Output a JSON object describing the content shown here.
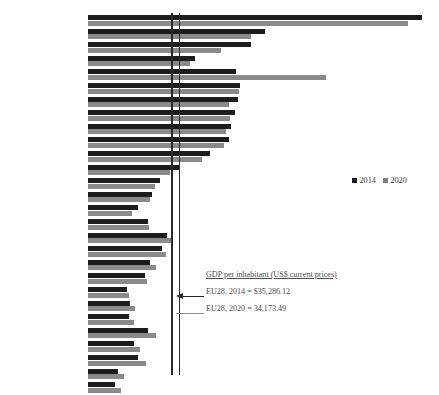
{
  "chart_data": {
    "type": "bar",
    "orientation": "horizontal",
    "title": "",
    "xlabel": "",
    "ylabel": "",
    "grid": false,
    "legend_position": "right-middle",
    "categories": [
      "Luxembourg",
      "Denmark",
      "Sweden",
      "United Kingdom",
      "Ireland",
      "Netherlands",
      "Austria",
      "Finland",
      "Germany",
      "Belgium",
      "France",
      "Italy",
      "Spain",
      "Cyprus",
      "Greece",
      "Portugal",
      "Malta",
      "Slovenia",
      "Czech Republic",
      "Slovak Republic",
      "Croatia",
      "Hungary",
      "Poland",
      "Estonia",
      "Latvia",
      "Lithuania",
      "Romania",
      ""
    ],
    "series": [
      {
        "name": "2014",
        "color": "#1c1c1c",
        "values": [
          119225,
          62549,
          59181,
          47425,
          42175,
          52300,
          51786,
          50343,
          48042,
          47316,
          43011,
          35518,
          29461,
          27194,
          21761,
          22080,
          24460,
          24002,
          20828,
          18500,
          13480,
          14100,
          14270,
          20170,
          15692,
          16540,
          10020,
          9650
        ]
      },
      {
        "name": "2020",
        "color": "#8a8a8a",
        "values": [
          115874,
          60915,
          52130,
          40318,
          85268,
          52397,
          48587,
          48981,
          46208,
          45159,
          39907,
          31676,
          26832,
          26624,
          17676,
          22440,
          27855,
          25517,
          22931,
          19157,
          13828,
          15899,
          15656,
          23027,
          17619,
          19998,
          12813,
          11000
        ]
      }
    ],
    "reference_lines": [
      {
        "name": "EU28, 2014",
        "value": 35286.12,
        "color": "#2a2a2a"
      },
      {
        "name": "EU28, 2020",
        "value": 34173.49,
        "color": "#2a2a2a"
      }
    ],
    "annotation": {
      "title": "GDP per inhabitant (US$ current prices)",
      "line_2014": "EU28, 2014 = $35,286.12",
      "line_2020": "EU28, 2020 = 34,173.49"
    },
    "legend": [
      {
        "label": "2014",
        "color": "#1c1c1c"
      },
      {
        "label": "2020",
        "color": "#7d7d7d"
      }
    ]
  },
  "render": {
    "bar_px_2014": [
      334,
      177,
      163,
      107,
      148,
      152,
      150,
      147,
      143,
      141,
      122,
      91,
      72,
      64,
      50,
      60,
      79,
      74,
      62,
      57,
      39,
      42,
      41,
      60,
      46,
      50,
      30,
      27
    ],
    "bar_px_2020": [
      320,
      163,
      133,
      102,
      238,
      151,
      141,
      142,
      138,
      136,
      114,
      82,
      67,
      62,
      44,
      61,
      85,
      78,
      68,
      59,
      41,
      47,
      46,
      68,
      52,
      58,
      36,
      33
    ],
    "row_pitch": 13.6,
    "row_top0": 14.0
  }
}
